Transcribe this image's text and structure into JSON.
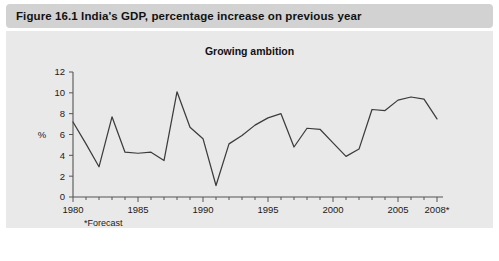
{
  "figure": {
    "caption": "Figure 16.1  India's GDP, percentage increase on previous year",
    "caption_bg": "#d2d2d2",
    "panel_bg": "#e9e9e9"
  },
  "chart_data": {
    "type": "line",
    "title": "Growing ambition",
    "xlabel": "",
    "ylabel": "%",
    "footnote": "*Forecast",
    "grid": false,
    "legend": "none",
    "line_color": "#3c3c3c",
    "xlim": [
      1980,
      2008
    ],
    "ylim": [
      0,
      12
    ],
    "ytick_step": 2,
    "yticks": [
      "0",
      "2",
      "4",
      "6",
      "8",
      "10",
      "12"
    ],
    "xticks": [
      "1980",
      "1985",
      "1990",
      "1995",
      "2000",
      "2005",
      "2008*"
    ],
    "xtick_values": [
      1980,
      1985,
      1990,
      1995,
      2000,
      2005,
      2008
    ],
    "x": [
      1980,
      1981,
      1982,
      1983,
      1984,
      1985,
      1986,
      1987,
      1988,
      1989,
      1990,
      1991,
      1992,
      1993,
      1994,
      1995,
      1996,
      1997,
      1998,
      1999,
      2000,
      2001,
      2002,
      2003,
      2004,
      2005,
      2006,
      2007,
      2008
    ],
    "values": [
      7.2,
      5.1,
      2.9,
      7.7,
      4.3,
      4.2,
      4.3,
      3.5,
      10.1,
      6.7,
      5.6,
      1.1,
      5.1,
      5.9,
      6.9,
      7.6,
      8.0,
      4.8,
      6.6,
      6.5,
      5.2,
      3.9,
      4.6,
      8.4,
      8.3,
      9.3,
      9.6,
      9.4,
      7.5
    ],
    "series_name": "India GDP growth"
  }
}
